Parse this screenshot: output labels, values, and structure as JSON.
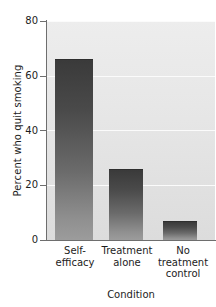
{
  "chart_data": {
    "type": "bar",
    "title": "",
    "subtitle": "",
    "xlabel": "Condition",
    "ylabel": "Percent who quit smoking",
    "categories": [
      "Self-efficacy",
      "Treatment alone",
      "No treatment control"
    ],
    "category_lines": [
      [
        "Self-",
        "efficacy"
      ],
      [
        "Treatment",
        "alone"
      ],
      [
        "No",
        "treatment",
        "control"
      ]
    ],
    "values": [
      66,
      26,
      7
    ],
    "ylim": [
      0,
      80
    ],
    "yticks": [
      0,
      20,
      40,
      60,
      80
    ],
    "ytick_labels": [
      "0",
      "20",
      "40",
      "60",
      "80"
    ],
    "grid": true,
    "grid_axis": "y",
    "legend": "none",
    "colors": {
      "bar_top": "#3a3a3a",
      "bar_bottom": "#9c9c9c",
      "plot_background": "#e6e6e6",
      "gridline": "#fbfbfb",
      "axis": "#6e6e6e",
      "text": "#1c1c1c",
      "figure_background": "#ffffff"
    }
  }
}
